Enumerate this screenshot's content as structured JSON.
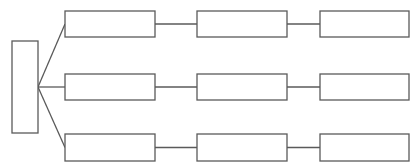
{
  "diagram": {
    "type": "tree",
    "root": {
      "label": "",
      "x": 12,
      "y": 41,
      "w": 26,
      "h": 92
    },
    "junction": {
      "x": 38,
      "y": 87
    },
    "rows": [
      {
        "y": 11,
        "h": 26,
        "boxes": [
          {
            "label": "",
            "x": 65,
            "w": 90
          },
          {
            "label": "",
            "x": 197,
            "w": 90
          },
          {
            "label": "",
            "x": 320,
            "w": 89
          }
        ]
      },
      {
        "y": 74,
        "h": 26,
        "boxes": [
          {
            "label": "",
            "x": 65,
            "w": 90
          },
          {
            "label": "",
            "x": 197,
            "w": 90
          },
          {
            "label": "",
            "x": 320,
            "w": 89
          }
        ]
      },
      {
        "y": 134,
        "h": 27,
        "boxes": [
          {
            "label": "",
            "x": 65,
            "w": 90
          },
          {
            "label": "",
            "x": 197,
            "w": 90
          },
          {
            "label": "",
            "x": 320,
            "w": 89
          }
        ]
      }
    ],
    "colors": {
      "stroke": "#5a5a5a",
      "fill": "#ffffff",
      "background": "#ffffff"
    }
  }
}
